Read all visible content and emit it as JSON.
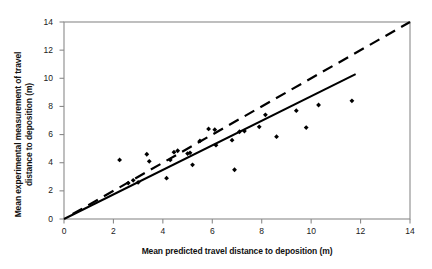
{
  "chart_data": {
    "type": "scatter",
    "title": "",
    "xlabel": "Mean predicted travel distance to deposition (m)",
    "ylabel_line1": "Mean experimental measurement of travel",
    "ylabel_line2": "distance to deposition (m)",
    "xlim": [
      0,
      14
    ],
    "ylim": [
      0,
      14
    ],
    "xticks": [
      0,
      2,
      4,
      6,
      8,
      10,
      12,
      14
    ],
    "yticks": [
      0,
      2,
      4,
      6,
      8,
      10,
      12,
      14
    ],
    "xtick_labels": [
      "0",
      "2",
      "4",
      "6",
      "8",
      "10",
      "12",
      "14"
    ],
    "ytick_labels": [
      "0",
      "2",
      "4",
      "6",
      "8",
      "10",
      "12",
      "14"
    ],
    "grid": false,
    "legend": "none",
    "marker": "diamond",
    "marker_color": "#000000",
    "points": [
      {
        "x": 2.25,
        "y": 4.2
      },
      {
        "x": 2.6,
        "y": 2.55
      },
      {
        "x": 2.8,
        "y": 2.75
      },
      {
        "x": 3.0,
        "y": 2.6
      },
      {
        "x": 3.35,
        "y": 4.6
      },
      {
        "x": 3.45,
        "y": 4.1
      },
      {
        "x": 4.15,
        "y": 2.9
      },
      {
        "x": 4.3,
        "y": 4.2
      },
      {
        "x": 4.45,
        "y": 4.75
      },
      {
        "x": 4.6,
        "y": 4.85
      },
      {
        "x": 5.0,
        "y": 4.65
      },
      {
        "x": 5.1,
        "y": 4.7
      },
      {
        "x": 5.2,
        "y": 3.85
      },
      {
        "x": 5.5,
        "y": 5.55
      },
      {
        "x": 5.85,
        "y": 6.4
      },
      {
        "x": 6.1,
        "y": 6.35
      },
      {
        "x": 6.15,
        "y": 5.25
      },
      {
        "x": 6.8,
        "y": 5.6
      },
      {
        "x": 6.9,
        "y": 3.5
      },
      {
        "x": 7.1,
        "y": 6.2
      },
      {
        "x": 7.3,
        "y": 6.25
      },
      {
        "x": 7.9,
        "y": 6.55
      },
      {
        "x": 8.15,
        "y": 7.4
      },
      {
        "x": 8.6,
        "y": 5.85
      },
      {
        "x": 9.4,
        "y": 7.7
      },
      {
        "x": 9.8,
        "y": 6.5
      },
      {
        "x": 10.3,
        "y": 8.1
      },
      {
        "x": 11.65,
        "y": 8.4
      }
    ],
    "lines": [
      {
        "name": "one-to-one-line",
        "style": "dashed",
        "color": "#000000",
        "width": 2.2,
        "x0": 0.35,
        "y0": 0.35,
        "x1": 14.0,
        "y1": 14.0
      },
      {
        "name": "regression-line",
        "style": "solid",
        "color": "#000000",
        "width": 2.0,
        "x0": 0.0,
        "y0": 0.0,
        "x1": 11.8,
        "y1": 10.3
      }
    ],
    "axis_color": "#8a8a8a",
    "frame": "box"
  }
}
